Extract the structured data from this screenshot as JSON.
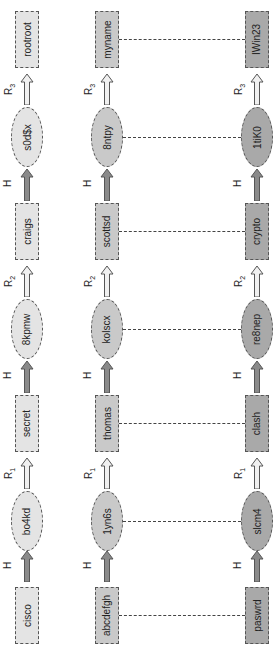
{
  "diagram": {
    "orientation": "rotated-90-ccw",
    "colors": {
      "row1_fill": "#e4e4e4",
      "row2_fill": "#c9c9c9",
      "row3_fill": "#a9a9a9",
      "hash_arrow": "#8a8a8a",
      "reduce_arrow": "#f0f0f0",
      "border": "#555555"
    },
    "arrow_labels": {
      "H": "H",
      "R": "R",
      "R1_sub": "1",
      "R2_sub": "2",
      "R3_sub": "3"
    },
    "chains": [
      {
        "start": "cisco",
        "h1": "bo4kd",
        "r1": "secret",
        "h2": "8kpmw",
        "r2": "craigs",
        "h3": "s0d$x",
        "end": "rootroot"
      },
      {
        "start": "abcdefgh",
        "h1": "1yn6s",
        "r1": "thomas",
        "h2": "kolscx",
        "r2": "scottsd",
        "h3": "8ntpy",
        "end": "myname"
      },
      {
        "start": "paswrd",
        "h1": "slcm4",
        "r1": "clash",
        "h2": "re8nep",
        "r2": "crypto",
        "h3": "1tiK0",
        "end": "IWin23"
      }
    ]
  }
}
